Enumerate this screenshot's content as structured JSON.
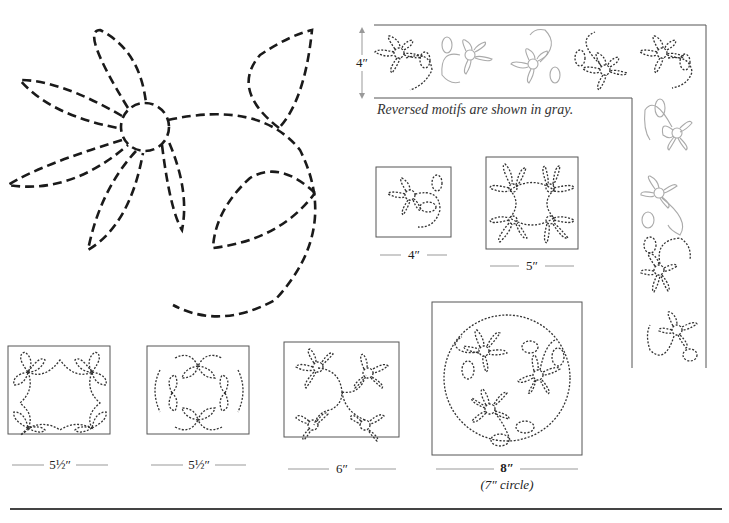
{
  "page": {
    "note": "Reversed motifs are shown in gray.",
    "border": {
      "height_label": "4″"
    },
    "blocks": [
      {
        "id": "block-4",
        "label": "4″"
      },
      {
        "id": "block-5",
        "label": "5″"
      },
      {
        "id": "block-5-5a",
        "label": "5½″"
      },
      {
        "id": "block-5-5b",
        "label": "5½″"
      },
      {
        "id": "block-6",
        "label": "6″"
      },
      {
        "id": "block-8",
        "label": "8″",
        "sublabel": "(7″ circle)"
      }
    ]
  }
}
